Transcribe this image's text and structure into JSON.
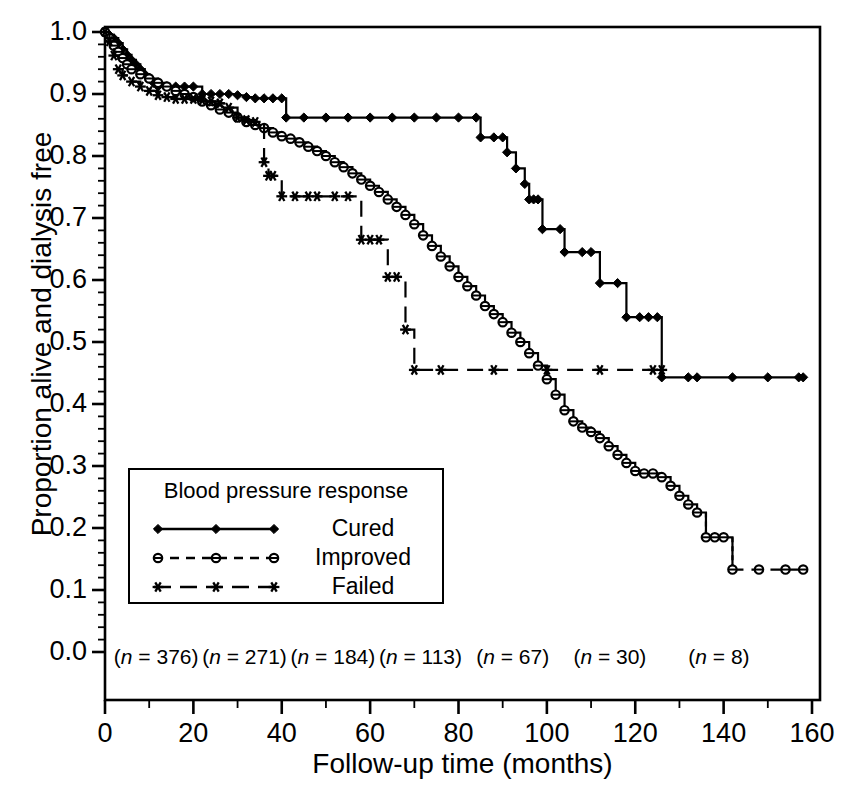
{
  "chart_data": {
    "type": "line",
    "subtype": "kaplan-meier-step",
    "title": "",
    "xlabel": "Follow-up time (months)",
    "ylabel": "Proportion alive and dialysis free",
    "xlim": [
      0,
      160
    ],
    "ylim": [
      0.0,
      1.0
    ],
    "xticks": [
      0,
      20,
      40,
      60,
      80,
      100,
      120,
      140,
      160
    ],
    "xticklabels": [
      "0",
      "20",
      "40",
      "60",
      "80",
      "100",
      "120",
      "140",
      "160"
    ],
    "xminor_step": 10,
    "yticks": [
      0.0,
      0.1,
      0.2,
      0.3,
      0.4,
      0.5,
      0.6,
      0.7,
      0.8,
      0.9,
      1.0
    ],
    "yticklabels": [
      "0.0",
      "0.1",
      "0.2",
      "0.3",
      "0.4",
      "0.5",
      "0.6",
      "0.7",
      "0.8",
      "0.9",
      "1.0"
    ],
    "yminor_step": 0.02,
    "grid": false,
    "frame": true,
    "legend": {
      "position": "inside-lower-left",
      "title": "Blood pressure response",
      "entries": [
        {
          "label": "Cured",
          "marker": "filled-diamond",
          "linestyle": "solid"
        },
        {
          "label": "Improved",
          "marker": "open-circle",
          "linestyle": "dashed"
        },
        {
          "label": "Failed",
          "marker": "asterisk",
          "linestyle": "dash-long"
        }
      ]
    },
    "at_risk_annotations": {
      "prefix": "(n = ",
      "suffix": ")",
      "labels": [
        "(n = 376)",
        "(n = 271)",
        "(n = 184)",
        "(n = 113)",
        "(n = 67)",
        "(n = 30)",
        "(n = 8)"
      ],
      "values": [
        376,
        271,
        184,
        113,
        67,
        30,
        8
      ],
      "at_times": [
        2,
        22,
        42,
        62,
        84,
        106,
        132
      ]
    },
    "series": [
      {
        "name": "Cured",
        "marker": "filled-diamond",
        "linestyle": "solid",
        "points": [
          [
            0,
            1.0
          ],
          [
            1,
            0.995
          ],
          [
            2,
            0.99
          ],
          [
            3,
            0.982
          ],
          [
            4,
            0.972
          ],
          [
            5,
            0.963
          ],
          [
            6,
            0.955
          ],
          [
            7,
            0.948
          ],
          [
            8,
            0.94
          ],
          [
            9,
            0.932
          ],
          [
            10,
            0.925
          ],
          [
            11,
            0.918
          ],
          [
            12,
            0.912
          ],
          [
            14,
            0.912
          ],
          [
            16,
            0.912
          ],
          [
            18,
            0.912
          ],
          [
            20,
            0.912
          ],
          [
            22,
            0.9
          ],
          [
            24,
            0.9
          ],
          [
            26,
            0.9
          ],
          [
            28,
            0.9
          ],
          [
            30,
            0.898
          ],
          [
            32,
            0.895
          ],
          [
            34,
            0.893
          ],
          [
            36,
            0.893
          ],
          [
            38,
            0.893
          ],
          [
            40,
            0.893
          ],
          [
            41,
            0.862
          ],
          [
            45,
            0.862
          ],
          [
            50,
            0.862
          ],
          [
            55,
            0.862
          ],
          [
            60,
            0.862
          ],
          [
            65,
            0.862
          ],
          [
            70,
            0.862
          ],
          [
            75,
            0.862
          ],
          [
            80,
            0.862
          ],
          [
            84,
            0.862
          ],
          [
            85,
            0.83
          ],
          [
            88,
            0.83
          ],
          [
            90,
            0.83
          ],
          [
            91,
            0.806
          ],
          [
            93,
            0.78
          ],
          [
            95,
            0.755
          ],
          [
            96,
            0.73
          ],
          [
            97,
            0.73
          ],
          [
            98,
            0.73
          ],
          [
            99,
            0.682
          ],
          [
            103,
            0.682
          ],
          [
            104,
            0.645
          ],
          [
            108,
            0.645
          ],
          [
            110,
            0.645
          ],
          [
            112,
            0.595
          ],
          [
            116,
            0.595
          ],
          [
            118,
            0.54
          ],
          [
            121,
            0.54
          ],
          [
            123,
            0.54
          ],
          [
            125,
            0.54
          ],
          [
            126,
            0.443
          ],
          [
            132,
            0.443
          ],
          [
            134,
            0.443
          ],
          [
            142,
            0.443
          ],
          [
            150,
            0.443
          ],
          [
            157,
            0.443
          ],
          [
            158,
            0.443
          ]
        ]
      },
      {
        "name": "Improved",
        "marker": "open-circle",
        "linestyle": "dashed-tail",
        "points": [
          [
            0,
            1.0
          ],
          [
            1,
            0.99
          ],
          [
            2,
            0.978
          ],
          [
            3,
            0.968
          ],
          [
            4,
            0.958
          ],
          [
            5,
            0.948
          ],
          [
            6,
            0.94
          ],
          [
            8,
            0.932
          ],
          [
            10,
            0.925
          ],
          [
            12,
            0.918
          ],
          [
            14,
            0.912
          ],
          [
            16,
            0.905
          ],
          [
            18,
            0.9
          ],
          [
            20,
            0.895
          ],
          [
            22,
            0.888
          ],
          [
            24,
            0.882
          ],
          [
            26,
            0.875
          ],
          [
            28,
            0.87
          ],
          [
            30,
            0.862
          ],
          [
            32,
            0.855
          ],
          [
            34,
            0.85
          ],
          [
            36,
            0.845
          ],
          [
            38,
            0.838
          ],
          [
            40,
            0.832
          ],
          [
            42,
            0.828
          ],
          [
            44,
            0.822
          ],
          [
            46,
            0.815
          ],
          [
            48,
            0.808
          ],
          [
            50,
            0.8
          ],
          [
            52,
            0.79
          ],
          [
            54,
            0.782
          ],
          [
            56,
            0.772
          ],
          [
            58,
            0.762
          ],
          [
            60,
            0.752
          ],
          [
            62,
            0.742
          ],
          [
            64,
            0.73
          ],
          [
            66,
            0.718
          ],
          [
            68,
            0.705
          ],
          [
            70,
            0.69
          ],
          [
            72,
            0.672
          ],
          [
            74,
            0.655
          ],
          [
            76,
            0.638
          ],
          [
            78,
            0.622
          ],
          [
            80,
            0.605
          ],
          [
            82,
            0.59
          ],
          [
            84,
            0.575
          ],
          [
            86,
            0.558
          ],
          [
            88,
            0.545
          ],
          [
            90,
            0.532
          ],
          [
            92,
            0.515
          ],
          [
            94,
            0.5
          ],
          [
            96,
            0.482
          ],
          [
            98,
            0.462
          ],
          [
            100,
            0.44
          ],
          [
            102,
            0.415
          ],
          [
            104,
            0.39
          ],
          [
            106,
            0.372
          ],
          [
            108,
            0.362
          ],
          [
            110,
            0.355
          ],
          [
            112,
            0.345
          ],
          [
            114,
            0.332
          ],
          [
            116,
            0.318
          ],
          [
            118,
            0.305
          ],
          [
            120,
            0.292
          ],
          [
            122,
            0.288
          ],
          [
            124,
            0.288
          ],
          [
            126,
            0.282
          ],
          [
            128,
            0.268
          ],
          [
            130,
            0.252
          ],
          [
            132,
            0.238
          ],
          [
            134,
            0.225
          ],
          [
            136,
            0.185
          ],
          [
            138,
            0.185
          ],
          [
            140,
            0.185
          ],
          [
            142,
            0.133
          ],
          [
            148,
            0.133
          ],
          [
            154,
            0.133
          ],
          [
            158,
            0.133
          ]
        ]
      },
      {
        "name": "Failed",
        "marker": "asterisk",
        "linestyle": "dash-long",
        "points": [
          [
            0,
            1.0
          ],
          [
            1,
            0.985
          ],
          [
            2,
            0.962
          ],
          [
            3,
            0.94
          ],
          [
            4,
            0.93
          ],
          [
            6,
            0.92
          ],
          [
            8,
            0.912
          ],
          [
            10,
            0.905
          ],
          [
            12,
            0.898
          ],
          [
            14,
            0.895
          ],
          [
            16,
            0.892
          ],
          [
            18,
            0.892
          ],
          [
            20,
            0.892
          ],
          [
            22,
            0.89
          ],
          [
            24,
            0.888
          ],
          [
            26,
            0.885
          ],
          [
            28,
            0.878
          ],
          [
            30,
            0.862
          ],
          [
            32,
            0.858
          ],
          [
            34,
            0.855
          ],
          [
            36,
            0.79
          ],
          [
            37,
            0.768
          ],
          [
            38,
            0.768
          ],
          [
            40,
            0.735
          ],
          [
            43,
            0.735
          ],
          [
            46,
            0.735
          ],
          [
            48,
            0.735
          ],
          [
            52,
            0.735
          ],
          [
            55,
            0.735
          ],
          [
            58,
            0.665
          ],
          [
            60,
            0.665
          ],
          [
            62,
            0.665
          ],
          [
            64,
            0.605
          ],
          [
            66,
            0.605
          ],
          [
            68,
            0.52
          ],
          [
            70,
            0.455
          ],
          [
            76,
            0.455
          ],
          [
            82,
            0.455
          ],
          [
            88,
            0.455
          ],
          [
            94,
            0.455
          ],
          [
            100,
            0.455
          ],
          [
            106,
            0.455
          ],
          [
            112,
            0.455
          ],
          [
            118,
            0.455
          ],
          [
            124,
            0.455
          ],
          [
            126,
            0.455
          ]
        ]
      }
    ]
  }
}
